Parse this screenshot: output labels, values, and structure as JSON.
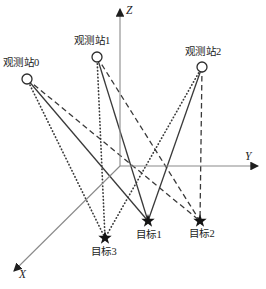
{
  "figure": {
    "background": "#ffffff",
    "colors": {
      "connection": "#3a3a3a",
      "axis": "#8a8a8a",
      "arrowhead": "#1f1f1f",
      "station_stroke": "#2d2d2d",
      "station_fill": "#ffffff",
      "star_fill": "#141414",
      "text": "#1c1c1c"
    },
    "axes": {
      "origin": {
        "x": 120,
        "y": 166
      },
      "items": [
        {
          "id": "z-axis",
          "label": "Z",
          "tip_x": 120,
          "tip_y": 9,
          "label_left": 126,
          "label_top": 5
        },
        {
          "id": "y-axis",
          "label": "Y",
          "tip_x": 258,
          "tip_y": 166,
          "label_left": 245,
          "label_top": 151
        },
        {
          "id": "x-axis",
          "label": "X",
          "tip_x": 14,
          "tip_y": 271,
          "label_left": 19,
          "label_top": 269
        }
      ]
    },
    "stations": [
      {
        "id": "station-0",
        "label": "观测站0",
        "x": 27,
        "y": 79,
        "label_left": 3,
        "label_top": 58
      },
      {
        "id": "station-1",
        "label": "观测站1",
        "x": 97,
        "y": 57,
        "label_left": 74,
        "label_top": 36
      },
      {
        "id": "station-2",
        "label": "观测站2",
        "x": 202,
        "y": 67,
        "label_left": 185,
        "label_top": 47
      }
    ],
    "targets": [
      {
        "id": "target-1",
        "label": "目标1",
        "x": 148,
        "y": 221,
        "line_style": "solid",
        "label_left": 136,
        "label_top": 230
      },
      {
        "id": "target-2",
        "label": "目标2",
        "x": 200,
        "y": 221,
        "line_style": "dashed",
        "label_left": 189,
        "label_top": 229
      },
      {
        "id": "target-3",
        "label": "目标3",
        "x": 105,
        "y": 238,
        "line_style": "dotted",
        "label_left": 91,
        "label_top": 247
      }
    ]
  }
}
